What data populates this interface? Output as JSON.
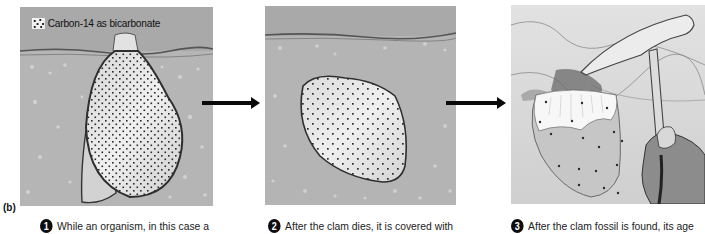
{
  "figure": {
    "label": "(b)",
    "legend": {
      "icon": "dotted-square-icon",
      "text": "Carbon-14 as bicarbonate"
    },
    "colors": {
      "sky": "#a9a9a9",
      "sediment": "#b6b6b6",
      "shell": "#e6e6e6",
      "shell_outline": "#3a3a3a",
      "dots": "#2a2a2a",
      "arrow": "#0a0a0a",
      "number_badge": "#0d0d0d"
    },
    "panels": [
      {
        "id": 1,
        "description": "Living clam upright in sediment, shell full of carbon-14 dots",
        "caption_number": "1",
        "caption_text": "While an organism, in this case a"
      },
      {
        "id": 2,
        "description": "Dead clam buried under sediment, fewer carbon-14 dots",
        "caption_number": "2",
        "caption_text": "After the clam dies, it is covered with"
      },
      {
        "id": 3,
        "description": "Clam fossil being dug out of rock with a rock hammer held by a hand, sparse carbon-14 dots",
        "caption_number": "3",
        "caption_text": "After the clam fossil is found, its age"
      }
    ],
    "arrows": [
      {
        "from": 1,
        "to": 2,
        "icon": "arrow-right-icon"
      },
      {
        "from": 2,
        "to": 3,
        "icon": "arrow-right-icon"
      }
    ]
  }
}
